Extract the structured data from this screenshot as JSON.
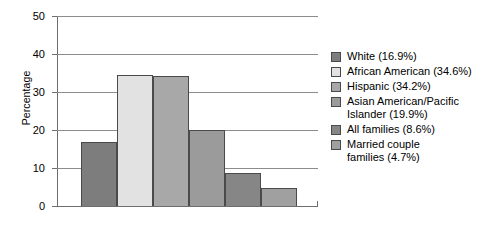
{
  "chart_data": {
    "type": "bar",
    "title": "",
    "xlabel": "",
    "ylabel": "Percentage",
    "ylim": [
      0,
      50
    ],
    "yticks": [
      "0",
      "10",
      "20",
      "30",
      "40",
      "50"
    ],
    "grid": true,
    "legend_position": "right",
    "categories": [
      "White",
      "African American",
      "Hispanic",
      "Asian American/Pacific Islander",
      "All families",
      "Married couple families"
    ],
    "values": [
      16.9,
      34.6,
      34.2,
      19.9,
      8.6,
      4.7
    ],
    "colors": [
      "#7d7d7d",
      "#e2e2e2",
      "#a8a8a8",
      "#9b9b9b",
      "#868686",
      "#a0a0a0"
    ],
    "legend": [
      {
        "label": "White (16.9%)",
        "color": "#7d7d7d"
      },
      {
        "label": "African American (34.6%)",
        "color": "#e2e2e2"
      },
      {
        "label": "Hispanic (34.2%)",
        "color": "#a8a8a8"
      },
      {
        "label": "Asian American/Pacific\nIslander (19.9%)",
        "color": "#9b9b9b"
      },
      {
        "label": "All families (8.6%)",
        "color": "#868686"
      },
      {
        "label": "Married couple\nfamilies (4.7%)",
        "color": "#a0a0a0"
      }
    ]
  }
}
